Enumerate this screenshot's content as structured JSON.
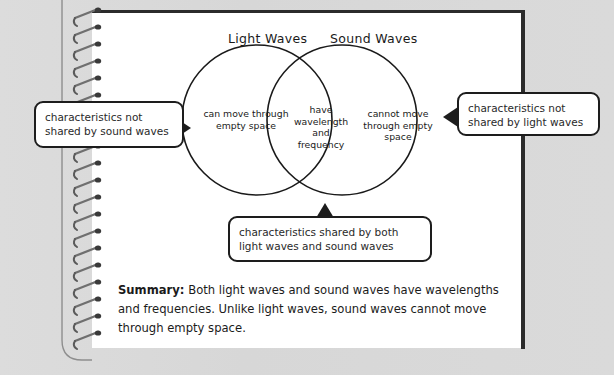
{
  "document": {
    "kind": "venn-diagram-worksheet",
    "page_background": "#ffffff",
    "backdrop_color": "#d9d9d9",
    "ink_color": "#1a1a1a"
  },
  "venn": {
    "left_title": "Light Waves",
    "right_title": "Sound Waves",
    "left_region": "can move through empty space",
    "center_region": "have wavelength and frequency",
    "right_region": "cannot move through empty space"
  },
  "callouts": {
    "left": "characteristics not shared by sound waves",
    "right": "characteristics not shared by light waves",
    "bottom": "characteristics shared by both light waves and sound waves"
  },
  "summary": {
    "label": "Summary:",
    "text": " Both light waves and sound waves have wavelengths and frequencies. Unlike light waves, sound waves cannot move through empty space."
  }
}
